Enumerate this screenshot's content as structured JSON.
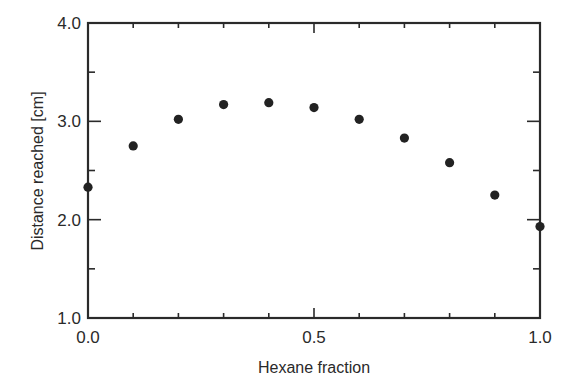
{
  "chart_data": {
    "type": "scatter",
    "title": "",
    "xlabel": "Hexane fraction",
    "ylabel": "Distance reached  [cm]",
    "xlim": [
      0.0,
      1.0
    ],
    "ylim": [
      1.0,
      4.0
    ],
    "x_ticks": [
      "0.0",
      "0.5",
      "1.0"
    ],
    "y_ticks": [
      "1.0",
      "2.0",
      "3.0",
      "4.0"
    ],
    "grid": false,
    "legend": null,
    "series": [
      {
        "name": "Distance reached",
        "marker": "filled-circle",
        "color": "#222222",
        "x": [
          0.0,
          0.1,
          0.2,
          0.3,
          0.4,
          0.5,
          0.6,
          0.7,
          0.8,
          0.9,
          1.0
        ],
        "y": [
          2.33,
          2.75,
          3.02,
          3.17,
          3.19,
          3.14,
          3.02,
          2.83,
          2.58,
          2.25,
          1.93
        ]
      }
    ]
  }
}
